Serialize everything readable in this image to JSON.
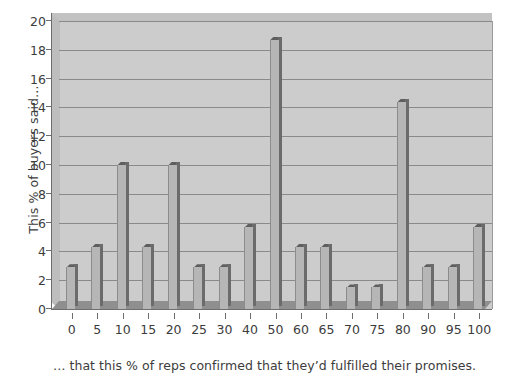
{
  "chart_data": {
    "type": "bar",
    "title": "",
    "subtitle": "",
    "xlabel": "… that this % of reps confirmed that they’d fulfilled their promises.",
    "ylabel": "This % of buyers said…",
    "categories": [
      "0",
      "5",
      "10",
      "15",
      "20",
      "25",
      "30",
      "40",
      "50",
      "60",
      "65",
      "70",
      "75",
      "80",
      "90",
      "95",
      "100"
    ],
    "values": [
      2.9,
      4.3,
      10.0,
      4.3,
      10.0,
      2.9,
      2.9,
      5.7,
      18.7,
      4.3,
      4.3,
      1.5,
      1.5,
      14.4,
      2.9,
      2.9,
      5.7
    ],
    "series": [
      {
        "name": "% of buyers",
        "values": [
          2.9,
          4.3,
          10.0,
          4.3,
          10.0,
          2.9,
          2.9,
          5.7,
          18.7,
          4.3,
          4.3,
          1.5,
          1.5,
          14.4,
          2.9,
          2.9,
          5.7
        ]
      }
    ],
    "ylim": [
      0,
      20
    ],
    "yticks": [
      0,
      2,
      4,
      6,
      8,
      10,
      12,
      14,
      16,
      18,
      20
    ],
    "ytick_labels": [
      "0",
      "2",
      "4",
      "6",
      "8",
      "10",
      "12",
      "14",
      "16",
      "18",
      "20"
    ],
    "grid": true,
    "grid_axis": "y",
    "legend": false,
    "legend_position": "none",
    "style_3d": true,
    "colors": {
      "plot_background": "#cccccc",
      "bar_face": "#b6b6b6",
      "bar_side": "#6b6b6b",
      "bar_top": "#5f5f5f",
      "gridline": "#8a8a8a",
      "axis": "#6e6e6e",
      "text": "#3c3c3c",
      "figure_background": "#ffffff"
    }
  }
}
